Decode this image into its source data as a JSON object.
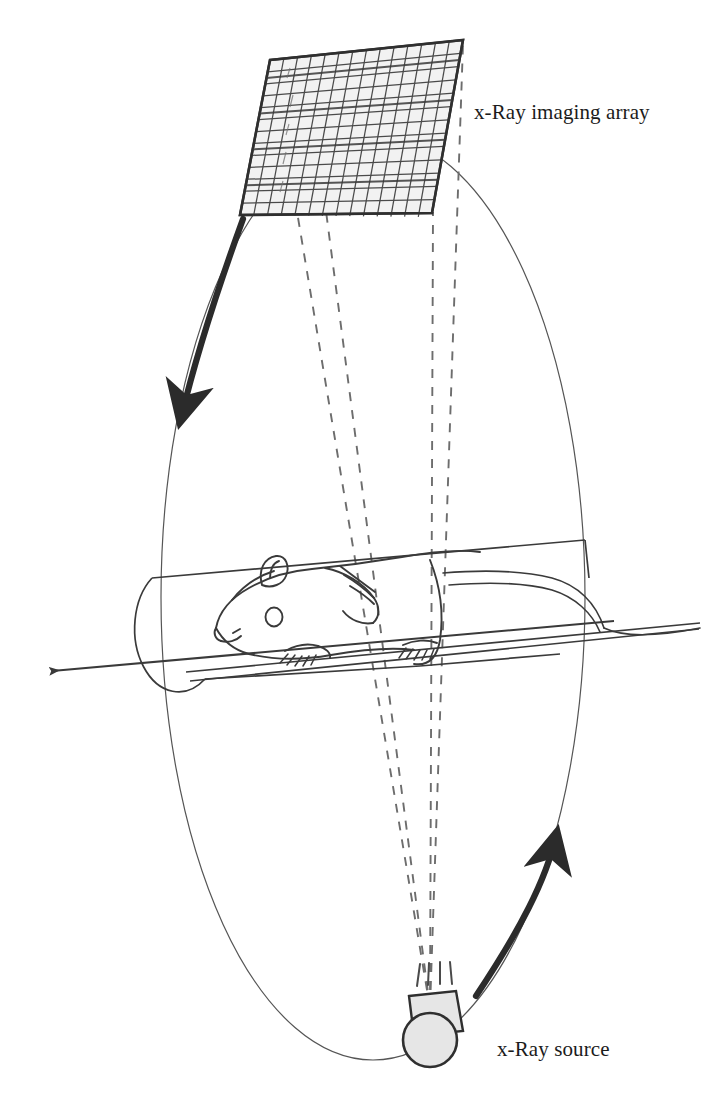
{
  "figure": {
    "background_color": "#ffffff",
    "ink_color": "#2b2b2b",
    "fill_gray": "#e8e8e8",
    "dash_color": "#6a6a6a",
    "orbit_color": "#555555"
  },
  "labels": {
    "detector": "x-Ray imaging array",
    "source": "x-Ray source"
  },
  "detector": {
    "name": "x-Ray imaging array",
    "shape": "parallelogram-grid",
    "corners": [
      [
        270,
        60
      ],
      [
        463,
        40
      ],
      [
        432,
        213
      ],
      [
        240,
        215
      ]
    ],
    "columns": 14,
    "rows": 13,
    "cell_fill": "#efefef",
    "line_color": "#3a3a3a"
  },
  "source": {
    "name": "x-Ray source",
    "shape": "circle-with-collimator",
    "center": [
      430,
      1040
    ],
    "radius": 27,
    "fill": "#e6e6e6",
    "collimator": {
      "shape": "trapezoid",
      "points": [
        [
          408,
          995
        ],
        [
          455,
          991
        ],
        [
          462,
          1030
        ],
        [
          413,
          1035
        ]
      ],
      "emission_ticks": 4
    }
  },
  "orbit": {
    "name": "rotation-orbit-ellipse",
    "type": "ellipse",
    "center": [
      373,
      597
    ],
    "rx": 212,
    "ry": 463,
    "stroke_width": 1.1
  },
  "cone_beam": {
    "name": "x-ray-cone-beam",
    "style": "dashed",
    "apex": [
      430,
      1010
    ],
    "rays_to_detector_points": [
      [
        272,
        62
      ],
      [
        305,
        58
      ],
      [
        434,
        212
      ],
      [
        463,
        44
      ]
    ],
    "dash_pattern": "9 9"
  },
  "rotation_arrows": [
    {
      "name": "detector-rotation-arrow",
      "direction": "counter-clockwise-down-left",
      "from": [
        243,
        218
      ],
      "to": [
        176,
        432
      ]
    },
    {
      "name": "source-rotation-arrow",
      "direction": "counter-clockwise-up-right",
      "from": [
        479,
        992
      ],
      "to": [
        558,
        822
      ]
    }
  ],
  "axis": {
    "name": "rotation-axis-arrow",
    "from": [
      612,
      622
    ],
    "to": [
      45,
      672
    ],
    "description": "long horizontal axis arrow pointing left through the animal bed"
  },
  "bed": {
    "name": "animal-bed-tray",
    "description": "half-cylinder tray supporting the animal, open top, rounded left end",
    "top_edge": [
      [
        152,
        578
      ],
      [
        585,
        540
      ]
    ],
    "bottom_rail": [
      [
        186,
        676
      ],
      [
        700,
        625
      ]
    ]
  },
  "subject": {
    "name": "mouse-subject",
    "description": "line drawing of a mouse lying on the bed, head to the left, tail extending right"
  }
}
